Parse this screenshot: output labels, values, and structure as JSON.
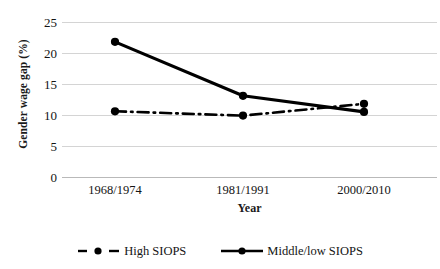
{
  "chart_data": {
    "type": "line",
    "title": "",
    "xlabel": "Year",
    "ylabel": "Gender wage gap (%)",
    "categories": [
      "1968/1974",
      "1981/1991",
      "2000/2010"
    ],
    "ylim": [
      0,
      25
    ],
    "yticks": [
      0,
      5,
      10,
      15,
      20,
      25
    ],
    "grid": true,
    "legend_position": "bottom",
    "series": [
      {
        "name": "High SIOPS",
        "values": [
          10.6,
          9.9,
          11.8
        ],
        "line_style": "dash-dot",
        "marker": "circle",
        "color": "#000000"
      },
      {
        "name": "Middle/low SIOPS",
        "values": [
          21.8,
          13.1,
          10.5
        ],
        "line_style": "solid",
        "marker": "circle",
        "color": "#000000"
      }
    ]
  },
  "axes": {
    "y_title": "Gender wage gap (%)",
    "x_title": "Year",
    "y_tick_labels": [
      "25",
      "20",
      "15",
      "10",
      "5",
      "0"
    ],
    "x_tick_labels": [
      "1968/1974",
      "1981/1991",
      "2000/2010"
    ]
  },
  "legend": {
    "items": [
      {
        "label": "High SIOPS",
        "swatch": "dash-dot-marker-icon"
      },
      {
        "label": "Middle/low SIOPS",
        "swatch": "solid-line-marker-icon"
      }
    ]
  },
  "colors": {
    "series": "#000000",
    "gridline": "#d4d4d4",
    "axis": "#b9b9b9",
    "text": "#141414",
    "background": "#ffffff"
  }
}
